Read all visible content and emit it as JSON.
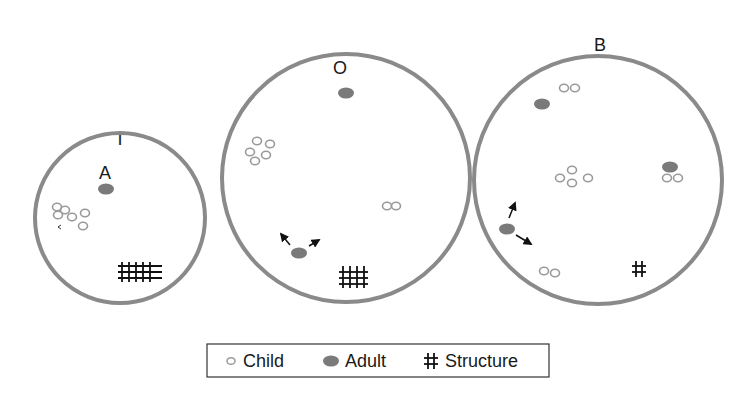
{
  "diagram": {
    "type": "territory-diagram",
    "colors": {
      "circle_stroke": "#8a8a8a",
      "adult_fill": "#7a7a7a",
      "child_stroke": "#9a9a9a",
      "structure": "#111111",
      "arrow": "#111111",
      "legend_border": "#333333"
    },
    "panels": [
      {
        "id": "I",
        "label": "I",
        "inner_label": "A",
        "adults": 1,
        "children": 6,
        "structure": "large grid (5x3)",
        "arrows": 0
      },
      {
        "id": "O",
        "label": "O",
        "adults": 2,
        "children": 7,
        "structure": "medium grid (4x3)",
        "arrows": 2
      },
      {
        "id": "B",
        "label": "B",
        "adults": 3,
        "children": 10,
        "structure": "small hash",
        "arrows": 2
      }
    ],
    "legend": [
      {
        "symbol": "child-icon",
        "label": "Child"
      },
      {
        "symbol": "adult-icon",
        "label": "Adult"
      },
      {
        "symbol": "structure-icon",
        "label": "Structure"
      }
    ]
  }
}
